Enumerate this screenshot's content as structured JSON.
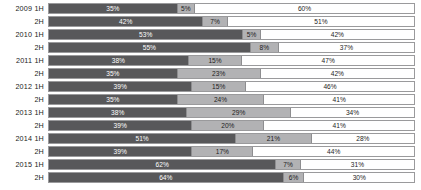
{
  "chart_data": {
    "type": "bar",
    "subtype": "stacked-horizontal-100",
    "title": "",
    "xlabel": "",
    "ylabel": "",
    "grid": false,
    "legend": null,
    "xlim": [
      0,
      100
    ],
    "axis_units": "percent",
    "categories": [
      "2009 1H",
      "2009 2H",
      "2010 1H",
      "2010 2H",
      "2011 1H",
      "2011 2H",
      "2012 1H",
      "2012 2H",
      "2013 1H",
      "2013 2H",
      "2014 1H",
      "2014 2H",
      "2015 1H",
      "2015 2H"
    ],
    "series": [
      {
        "name": "Segment 1",
        "color": "#58585a",
        "values": [
          35,
          42,
          53,
          55,
          38,
          35,
          39,
          35,
          38,
          39,
          51,
          39,
          62,
          64
        ]
      },
      {
        "name": "Segment 2",
        "color": "#b2b2b4",
        "values": [
          5,
          7,
          5,
          8,
          15,
          23,
          15,
          24,
          29,
          20,
          21,
          17,
          7,
          6
        ]
      },
      {
        "name": "Segment 3",
        "color": "#ffffff",
        "values": [
          60,
          51,
          42,
          37,
          47,
          42,
          46,
          41,
          34,
          41,
          28,
          44,
          31,
          30
        ]
      }
    ]
  },
  "rows": [
    {
      "label": "2009 1H",
      "year": "2009",
      "half": "1H",
      "segments": [
        {
          "value": 35,
          "text": "35%"
        },
        {
          "value": 5,
          "text": "5%"
        },
        {
          "value": 60,
          "text": "60%"
        }
      ]
    },
    {
      "label": "2H",
      "year": "2009",
      "half": "2H",
      "segments": [
        {
          "value": 42,
          "text": "42%"
        },
        {
          "value": 7,
          "text": "7%"
        },
        {
          "value": 51,
          "text": "51%"
        }
      ]
    },
    {
      "label": "2010 1H",
      "year": "2010",
      "half": "1H",
      "segments": [
        {
          "value": 53,
          "text": "53%"
        },
        {
          "value": 5,
          "text": "5%"
        },
        {
          "value": 42,
          "text": "42%"
        }
      ]
    },
    {
      "label": "2H",
      "year": "2010",
      "half": "2H",
      "segments": [
        {
          "value": 55,
          "text": "55%"
        },
        {
          "value": 8,
          "text": "8%"
        },
        {
          "value": 37,
          "text": "37%"
        }
      ]
    },
    {
      "label": "2011 1H",
      "year": "2011",
      "half": "1H",
      "segments": [
        {
          "value": 38,
          "text": "38%"
        },
        {
          "value": 15,
          "text": "15%"
        },
        {
          "value": 47,
          "text": "47%"
        }
      ]
    },
    {
      "label": "2H",
      "year": "2011",
      "half": "2H",
      "segments": [
        {
          "value": 35,
          "text": "35%"
        },
        {
          "value": 23,
          "text": "23%"
        },
        {
          "value": 42,
          "text": "42%"
        }
      ]
    },
    {
      "label": "2012 1H",
      "year": "2012",
      "half": "1H",
      "segments": [
        {
          "value": 39,
          "text": "39%"
        },
        {
          "value": 15,
          "text": "15%"
        },
        {
          "value": 46,
          "text": "46%"
        }
      ]
    },
    {
      "label": "2H",
      "year": "2012",
      "half": "2H",
      "segments": [
        {
          "value": 35,
          "text": "35%"
        },
        {
          "value": 24,
          "text": "24%"
        },
        {
          "value": 41,
          "text": "41%"
        }
      ]
    },
    {
      "label": "2013 1H",
      "year": "2013",
      "half": "1H",
      "segments": [
        {
          "value": 38,
          "text": "38%"
        },
        {
          "value": 29,
          "text": "29%"
        },
        {
          "value": 34,
          "text": "34%"
        }
      ]
    },
    {
      "label": "2H",
      "year": "2013",
      "half": "2H",
      "segments": [
        {
          "value": 39,
          "text": "39%"
        },
        {
          "value": 20,
          "text": "20%"
        },
        {
          "value": 41,
          "text": "41%"
        }
      ]
    },
    {
      "label": "2014 1H",
      "year": "2014",
      "half": "1H",
      "segments": [
        {
          "value": 51,
          "text": "51%"
        },
        {
          "value": 21,
          "text": "21%"
        },
        {
          "value": 28,
          "text": "28%"
        }
      ]
    },
    {
      "label": "2H",
      "year": "2014",
      "half": "2H",
      "segments": [
        {
          "value": 39,
          "text": "39%"
        },
        {
          "value": 17,
          "text": "17%"
        },
        {
          "value": 44,
          "text": "44%"
        }
      ]
    },
    {
      "label": "2015 1H",
      "year": "2015",
      "half": "1H",
      "segments": [
        {
          "value": 62,
          "text": "62%"
        },
        {
          "value": 7,
          "text": "7%"
        },
        {
          "value": 31,
          "text": "31%"
        }
      ]
    },
    {
      "label": "2H",
      "year": "2015",
      "half": "2H",
      "segments": [
        {
          "value": 64,
          "text": "64%"
        },
        {
          "value": 6,
          "text": "6%"
        },
        {
          "value": 30,
          "text": "30%"
        }
      ]
    }
  ]
}
